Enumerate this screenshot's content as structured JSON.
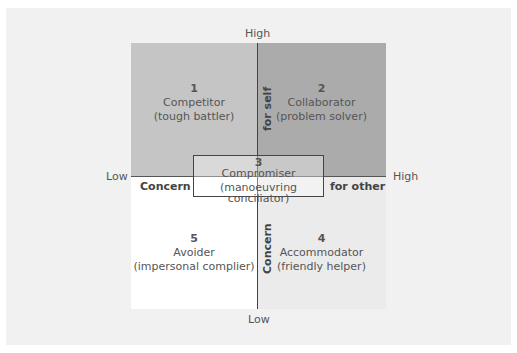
{
  "axes": {
    "top": "High",
    "bottom": "Low",
    "left": "Low",
    "right": "High",
    "vertical_title_top": "for self",
    "vertical_title_bottom": "Concern",
    "horizontal_title_left": "Concern",
    "horizontal_title_right": "for other"
  },
  "quadrants": [
    {
      "num": "1",
      "title": "Competitor",
      "subtitle": "(tough battler)"
    },
    {
      "num": "2",
      "title": "Collaborator",
      "subtitle": "(problem solver)"
    },
    {
      "num": "3",
      "title": "Compromiser",
      "subtitle": "(manoeuvring conciliator)"
    },
    {
      "num": "4",
      "title": "Accommodator",
      "subtitle": "(friendly helper)"
    },
    {
      "num": "5",
      "title": "Avoider",
      "subtitle": "(impersonal complier)"
    }
  ],
  "colors": {
    "top_left": "#c5c5c5",
    "top_right": "#ababab",
    "bottom_left": "#ffffff",
    "bottom_right": "#ebebeb",
    "background": "#f1f1f1"
  }
}
